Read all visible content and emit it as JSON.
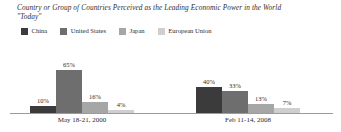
{
  "chart_data": {
    "type": "bar",
    "title": "Country or Group of Countries Perceived as the Leading Economic Power in the World \"Today\"",
    "title_line1": "Country or Group of Countries Perceived as the Leading Economic Power in the World",
    "title_line2": "\"Today\"",
    "xlabel": "",
    "ylabel": "",
    "ylim": [
      0,
      100
    ],
    "grid": false,
    "legend_position": "top-left",
    "categories": [
      "May 18-21, 2000",
      "Feb 11-14, 2008"
    ],
    "series": [
      {
        "name": "China",
        "color": "#3b3b3b",
        "values": [
          10,
          40
        ],
        "labels": [
          "10%",
          "40%"
        ]
      },
      {
        "name": "United States",
        "color": "#6e6e6e",
        "values": [
          65,
          33
        ],
        "labels": [
          "65%",
          "33%"
        ]
      },
      {
        "name": "Japan",
        "color": "#a6a6a6",
        "values": [
          16,
          13
        ],
        "labels": [
          "16%",
          "13%"
        ]
      },
      {
        "name": "European Union",
        "color": "#cfcfcf",
        "values": [
          4,
          7
        ],
        "labels": [
          "4%",
          "7%"
        ]
      }
    ]
  },
  "legend": {
    "items": [
      {
        "label": "China",
        "color": "#3b3b3b"
      },
      {
        "label": "United States",
        "color": "#6e6e6e"
      },
      {
        "label": "Japan",
        "color": "#a6a6a6"
      },
      {
        "label": "European Union",
        "color": "#cfcfcf"
      }
    ]
  },
  "groups": [
    {
      "label": "May 18-21, 2000",
      "bars": [
        {
          "series": "China",
          "label": "10%",
          "value": 10,
          "color": "#3b3b3b"
        },
        {
          "series": "United States",
          "label": "65%",
          "value": 65,
          "color": "#6e6e6e"
        },
        {
          "series": "Japan",
          "label": "16%",
          "value": 16,
          "color": "#a6a6a6"
        },
        {
          "series": "European Union",
          "label": "4%",
          "value": 4,
          "color": "#cfcfcf"
        }
      ]
    },
    {
      "label": "Feb 11-14, 2008",
      "bars": [
        {
          "series": "China",
          "label": "40%",
          "value": 40,
          "color": "#3b3b3b"
        },
        {
          "series": "United States",
          "label": "33%",
          "value": 33,
          "color": "#6e6e6e"
        },
        {
          "series": "Japan",
          "label": "13%",
          "value": 13,
          "color": "#a6a6a6"
        },
        {
          "series": "European Union",
          "label": "7%",
          "value": 7,
          "color": "#cfcfcf"
        }
      ]
    }
  ],
  "axis": {
    "baseline_color": "#9b9b9b"
  }
}
